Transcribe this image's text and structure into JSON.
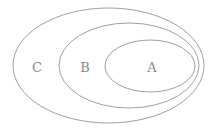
{
  "diagram": {
    "type": "nested-venn",
    "stroke_color": "#a0a0a0",
    "label_color": "#8a8a8a",
    "sets": [
      {
        "name": "C",
        "label": "C",
        "contains": [
          "B"
        ]
      },
      {
        "name": "B",
        "label": "B",
        "contains": [
          "A"
        ]
      },
      {
        "name": "A",
        "label": "A",
        "contains": []
      }
    ]
  }
}
